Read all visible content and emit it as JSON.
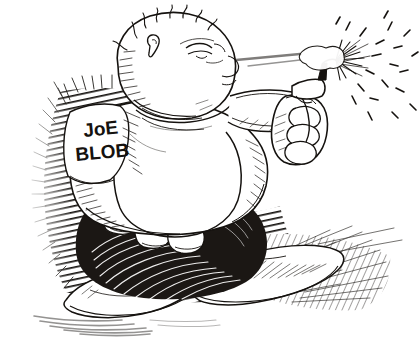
{
  "artwork": {
    "title": "Joe Blob",
    "medium": "pen-and-ink cartoon illustration",
    "description": "A grossly obese bald cartoon man in a white t-shirt and long white sneakers, sitting and firing a handgun to the right",
    "background_color": "#ffffff",
    "ink_color": "#15120f",
    "paper_tone": "#fdfdfc"
  },
  "labels": {
    "shirt_line_1": "JoE",
    "shirt_line_2": "BLOB"
  },
  "figure": {
    "head_label": "bald blobby head with sparse spiky hairs",
    "eye_label": "squinting eye",
    "ear_label": "small curled ear",
    "belly_label": "huge white belly",
    "arm_label": "outstretched right arm",
    "fist_label": "fist gripping pistol",
    "toes_label": "rounded bare toes",
    "shoe_left_label": "long white sneaker",
    "shoe_right_label": "long white sneaker"
  },
  "effects": {
    "muzzle_flash_label": "muzzle flash burst",
    "smoke_label": "smoke puff",
    "debris_label": "scattered ink flecks",
    "tracer_label": "bullet tracer streak",
    "ground_shadow_label": "ground shadow smudge",
    "backdrop_label": "dense cross-hatched dark backdrop"
  }
}
